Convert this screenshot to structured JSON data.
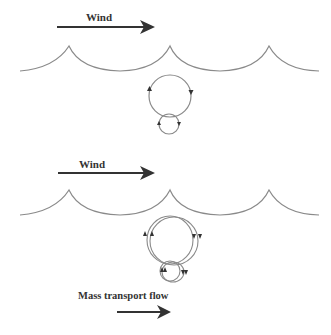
{
  "panels": [
    {
      "id": "no-net-transport",
      "wind_label": "Wind",
      "orbit_description": "closed circular orbits",
      "orbits": [
        {
          "cx": 170,
          "cy": 96,
          "r": 21
        },
        {
          "cx": 169,
          "cy": 124,
          "r": 10
        }
      ]
    },
    {
      "id": "mass-transport",
      "wind_label": "Wind",
      "orbit_description": "open orbits with forward drift",
      "orbits": [
        {
          "cx": 172,
          "cy": 241,
          "r": 24
        },
        {
          "cx": 172,
          "cy": 272,
          "r": 11
        }
      ],
      "flow_label": "Mass transport flow"
    }
  ],
  "colors": {
    "line": "#8a8a8a",
    "arrow": "#333333",
    "text": "#333333"
  }
}
